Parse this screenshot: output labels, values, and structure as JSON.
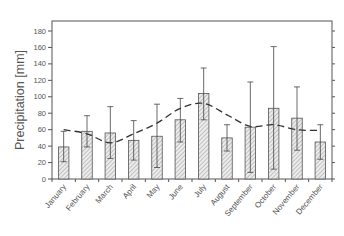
{
  "chart_data": {
    "type": "bar",
    "title": "",
    "xlabel": "",
    "ylabel": "Precipitation  [mm]",
    "ylim": [
      0,
      180
    ],
    "yticks": [
      0,
      20,
      40,
      60,
      80,
      100,
      120,
      140,
      160,
      180
    ],
    "grid": false,
    "legend": null,
    "categories": [
      "January",
      "February",
      "March",
      "April",
      "May",
      "June",
      "July",
      "August",
      "September",
      "October",
      "November",
      "December"
    ],
    "series": [
      {
        "name": "Monthly precipitation (bars, hatched)",
        "type": "bar",
        "values": [
          39,
          58,
          56,
          47,
          52,
          72,
          104,
          50,
          63,
          86,
          74,
          45
        ],
        "error_upper": [
          58,
          77,
          88,
          71,
          91,
          98,
          135,
          66,
          118,
          161,
          112,
          66
        ],
        "error_lower": [
          21,
          39,
          25,
          23,
          14,
          45,
          72,
          34,
          8,
          12,
          35,
          24
        ]
      },
      {
        "name": "Long-term mean (dashed line)",
        "type": "line",
        "style": "dashed",
        "values": [
          60,
          55,
          44,
          55,
          68,
          86,
          92,
          78,
          64,
          66,
          60,
          59
        ]
      }
    ],
    "colors": {
      "bar_fill": "#e4e4e4",
      "bar_hatch": "#8a8a8a",
      "bar_edge": "#555555",
      "line": "#333333",
      "axis": "#555555",
      "text": "#555555"
    }
  }
}
